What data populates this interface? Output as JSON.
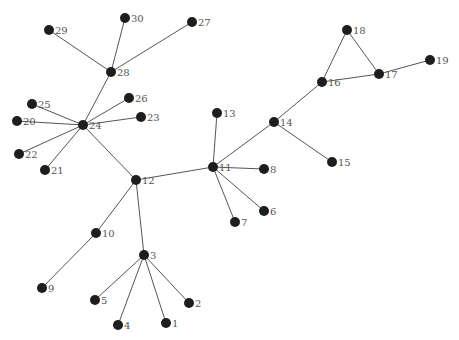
{
  "graph": {
    "node_color": "#1e1e1e",
    "edge_color": "#555555",
    "label_color": "#555555",
    "nodes": [
      {
        "id": "1",
        "x": 166,
        "y": 323
      },
      {
        "id": "2",
        "x": 189,
        "y": 303
      },
      {
        "id": "3",
        "x": 144,
        "y": 255
      },
      {
        "id": "4",
        "x": 118,
        "y": 325
      },
      {
        "id": "5",
        "x": 95,
        "y": 300
      },
      {
        "id": "6",
        "x": 264,
        "y": 211
      },
      {
        "id": "7",
        "x": 235,
        "y": 222
      },
      {
        "id": "8",
        "x": 264,
        "y": 169
      },
      {
        "id": "9",
        "x": 42,
        "y": 288
      },
      {
        "id": "10",
        "x": 96,
        "y": 233
      },
      {
        "id": "11",
        "x": 213,
        "y": 167
      },
      {
        "id": "12",
        "x": 136,
        "y": 180
      },
      {
        "id": "13",
        "x": 217,
        "y": 113
      },
      {
        "id": "14",
        "x": 274,
        "y": 122
      },
      {
        "id": "15",
        "x": 332,
        "y": 162
      },
      {
        "id": "16",
        "x": 322,
        "y": 82
      },
      {
        "id": "17",
        "x": 379,
        "y": 74
      },
      {
        "id": "18",
        "x": 347,
        "y": 30
      },
      {
        "id": "19",
        "x": 430,
        "y": 60
      },
      {
        "id": "20",
        "x": 17,
        "y": 121
      },
      {
        "id": "21",
        "x": 45,
        "y": 170
      },
      {
        "id": "22",
        "x": 19,
        "y": 154
      },
      {
        "id": "23",
        "x": 141,
        "y": 117
      },
      {
        "id": "24",
        "x": 83,
        "y": 125
      },
      {
        "id": "25",
        "x": 32,
        "y": 104
      },
      {
        "id": "26",
        "x": 129,
        "y": 98
      },
      {
        "id": "27",
        "x": 192,
        "y": 22
      },
      {
        "id": "28",
        "x": 111,
        "y": 72
      },
      {
        "id": "29",
        "x": 49,
        "y": 30
      },
      {
        "id": "30",
        "x": 125,
        "y": 18
      }
    ],
    "edges": [
      [
        "28",
        "30"
      ],
      [
        "28",
        "27"
      ],
      [
        "28",
        "29"
      ],
      [
        "28",
        "24"
      ],
      [
        "24",
        "25"
      ],
      [
        "24",
        "20"
      ],
      [
        "24",
        "22"
      ],
      [
        "24",
        "21"
      ],
      [
        "24",
        "26"
      ],
      [
        "24",
        "23"
      ],
      [
        "24",
        "12"
      ],
      [
        "12",
        "11"
      ],
      [
        "12",
        "10"
      ],
      [
        "12",
        "3"
      ],
      [
        "10",
        "9"
      ],
      [
        "3",
        "5"
      ],
      [
        "3",
        "4"
      ],
      [
        "3",
        "1"
      ],
      [
        "3",
        "2"
      ],
      [
        "11",
        "13"
      ],
      [
        "11",
        "8"
      ],
      [
        "11",
        "6"
      ],
      [
        "11",
        "7"
      ],
      [
        "11",
        "14"
      ],
      [
        "14",
        "15"
      ],
      [
        "14",
        "16"
      ],
      [
        "16",
        "18"
      ],
      [
        "16",
        "17"
      ],
      [
        "18",
        "17"
      ],
      [
        "17",
        "19"
      ]
    ]
  }
}
